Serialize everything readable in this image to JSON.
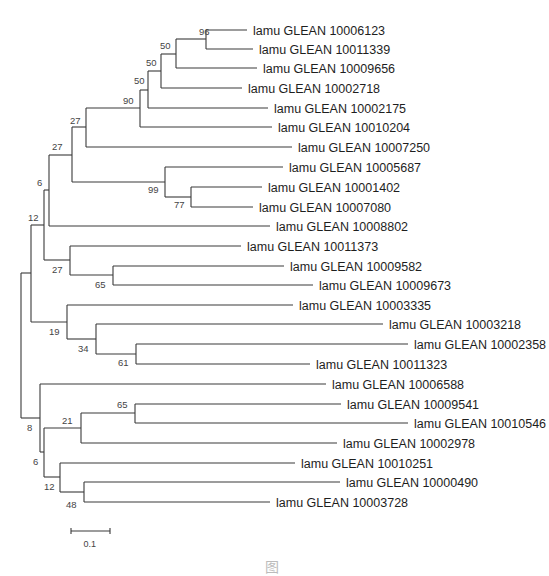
{
  "figure": {
    "type": "phylogenetic-tree",
    "scale_bar": {
      "label": "0.1",
      "x1": 71,
      "x2": 110,
      "y": 531
    },
    "caption_partial": "图"
  },
  "leaves": [
    {
      "label": "lamu GLEAN 10006123",
      "y": 30,
      "end": 247
    },
    {
      "label": "lamu GLEAN 10011339",
      "y": 49,
      "end": 253
    },
    {
      "label": "lamu GLEAN 10009656",
      "y": 68,
      "end": 257
    },
    {
      "label": "lamu GLEAN 10002718",
      "y": 88,
      "end": 242
    },
    {
      "label": "lamu GLEAN 10002175",
      "y": 108,
      "end": 268
    },
    {
      "label": "lamu GLEAN 10010204",
      "y": 127,
      "end": 272
    },
    {
      "label": "lamu GLEAN 10007250",
      "y": 147,
      "end": 292
    },
    {
      "label": "lamu GLEAN 10005687",
      "y": 167,
      "end": 283
    },
    {
      "label": "lamu GLEAN 10001402",
      "y": 187,
      "end": 262
    },
    {
      "label": "lamu GLEAN 10007080",
      "y": 207,
      "end": 253
    },
    {
      "label": "lamu GLEAN 10008802",
      "y": 226,
      "end": 270
    },
    {
      "label": "lamu GLEAN 10011373",
      "y": 246,
      "end": 241
    },
    {
      "label": "lamu GLEAN 10009582",
      "y": 266,
      "end": 284
    },
    {
      "label": "lamu GLEAN 10009673",
      "y": 285,
      "end": 313
    },
    {
      "label": "lamu GLEAN 10003335",
      "y": 305,
      "end": 293
    },
    {
      "label": "lamu GLEAN 10003218",
      "y": 324,
      "end": 383
    },
    {
      "label": "lamu GLEAN 10002358",
      "y": 344,
      "end": 408
    },
    {
      "label": "lamu GLEAN 10011323",
      "y": 364,
      "end": 310
    },
    {
      "label": "lamu GLEAN 10006588",
      "y": 384,
      "end": 326
    },
    {
      "label": "lamu GLEAN 10009541",
      "y": 404,
      "end": 341
    },
    {
      "label": "lamu GLEAN 10010546",
      "y": 423,
      "end": 408
    },
    {
      "label": "lamu GLEAN 10002978",
      "y": 443,
      "end": 337
    },
    {
      "label": "lamu GLEAN 10010251",
      "y": 463,
      "end": 295
    },
    {
      "label": "lamu GLEAN 10000490",
      "y": 482,
      "end": 340
    },
    {
      "label": "lamu GLEAN 10003728",
      "y": 502,
      "end": 270
    }
  ],
  "bootstrap_values": [
    {
      "value": "96",
      "x": 199,
      "y": 35
    },
    {
      "value": "50",
      "x": 160,
      "y": 49
    },
    {
      "value": "50",
      "x": 146,
      "y": 66
    },
    {
      "value": "50",
      "x": 134,
      "y": 84
    },
    {
      "value": "90",
      "x": 123,
      "y": 104
    },
    {
      "value": "27",
      "x": 70,
      "y": 124
    },
    {
      "value": "27",
      "x": 52,
      "y": 150
    },
    {
      "value": "99",
      "x": 148,
      "y": 193
    },
    {
      "value": "77",
      "x": 174,
      "y": 208
    },
    {
      "value": "6",
      "x": 37,
      "y": 186
    },
    {
      "value": "12",
      "x": 28,
      "y": 221
    },
    {
      "value": "27",
      "x": 52,
      "y": 273
    },
    {
      "value": "65",
      "x": 95,
      "y": 288
    },
    {
      "value": "19",
      "x": 49,
      "y": 335
    },
    {
      "value": "34",
      "x": 78,
      "y": 352
    },
    {
      "value": "61",
      "x": 118,
      "y": 366
    },
    {
      "value": "65",
      "x": 117,
      "y": 408
    },
    {
      "value": "21",
      "x": 62,
      "y": 424
    },
    {
      "value": "8",
      "x": 27,
      "y": 431
    },
    {
      "value": "6",
      "x": 33,
      "y": 465
    },
    {
      "value": "12",
      "x": 44,
      "y": 490
    },
    {
      "value": "48",
      "x": 66,
      "y": 508
    }
  ],
  "branches": [
    [
      206,
      30,
      206,
      49
    ],
    [
      206,
      30,
      247,
      30
    ],
    [
      206,
      49,
      253,
      49
    ],
    [
      176,
      39,
      176,
      68
    ],
    [
      176,
      39,
      206,
      39
    ],
    [
      176,
      68,
      257,
      68
    ],
    [
      161,
      54,
      161,
      88
    ],
    [
      161,
      54,
      176,
      54
    ],
    [
      161,
      88,
      242,
      88
    ],
    [
      148,
      71,
      148,
      108
    ],
    [
      148,
      71,
      161,
      71
    ],
    [
      148,
      108,
      268,
      108
    ],
    [
      140,
      90,
      140,
      127
    ],
    [
      140,
      90,
      148,
      90
    ],
    [
      140,
      127,
      272,
      127
    ],
    [
      86,
      108,
      86,
      147
    ],
    [
      86,
      108,
      140,
      108
    ],
    [
      86,
      147,
      292,
      147
    ],
    [
      165,
      167,
      165,
      197
    ],
    [
      165,
      167,
      283,
      167
    ],
    [
      165,
      197,
      191,
      197
    ],
    [
      191,
      187,
      191,
      207
    ],
    [
      191,
      187,
      262,
      187
    ],
    [
      191,
      207,
      253,
      207
    ],
    [
      72,
      127,
      72,
      182
    ],
    [
      72,
      127,
      86,
      127
    ],
    [
      72,
      182,
      165,
      182
    ],
    [
      49,
      155,
      49,
      226
    ],
    [
      49,
      155,
      72,
      155
    ],
    [
      49,
      226,
      270,
      226
    ],
    [
      113,
      266,
      113,
      285
    ],
    [
      113,
      266,
      284,
      266
    ],
    [
      113,
      285,
      313,
      285
    ],
    [
      70,
      246,
      70,
      275
    ],
    [
      70,
      246,
      241,
      246
    ],
    [
      70,
      275,
      113,
      275
    ],
    [
      44,
      190,
      44,
      260
    ],
    [
      44,
      190,
      49,
      190
    ],
    [
      44,
      260,
      70,
      260
    ],
    [
      136,
      344,
      136,
      364
    ],
    [
      136,
      344,
      408,
      344
    ],
    [
      136,
      364,
      310,
      364
    ],
    [
      96,
      324,
      96,
      354
    ],
    [
      96,
      324,
      383,
      324
    ],
    [
      96,
      354,
      136,
      354
    ],
    [
      67,
      305,
      67,
      339
    ],
    [
      67,
      305,
      293,
      305
    ],
    [
      67,
      339,
      96,
      339
    ],
    [
      31,
      225,
      31,
      322
    ],
    [
      31,
      225,
      44,
      225
    ],
    [
      31,
      322,
      67,
      322
    ],
    [
      135,
      404,
      135,
      423
    ],
    [
      135,
      404,
      341,
      404
    ],
    [
      135,
      423,
      408,
      423
    ],
    [
      81,
      413,
      81,
      443
    ],
    [
      81,
      413,
      135,
      413
    ],
    [
      81,
      443,
      337,
      443
    ],
    [
      84,
      482,
      84,
      502
    ],
    [
      84,
      482,
      340,
      482
    ],
    [
      84,
      502,
      270,
      502
    ],
    [
      60,
      463,
      60,
      492
    ],
    [
      60,
      463,
      295,
      463
    ],
    [
      60,
      492,
      84,
      492
    ],
    [
      44,
      428,
      44,
      477
    ],
    [
      44,
      428,
      81,
      428
    ],
    [
      44,
      477,
      60,
      477
    ],
    [
      40,
      384,
      40,
      452
    ],
    [
      40,
      384,
      326,
      384
    ],
    [
      40,
      452,
      44,
      452
    ],
    [
      21,
      273,
      21,
      418
    ],
    [
      21,
      273,
      31,
      273
    ],
    [
      21,
      418,
      40,
      418
    ]
  ]
}
